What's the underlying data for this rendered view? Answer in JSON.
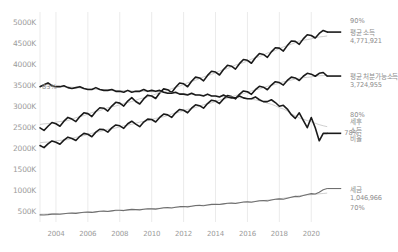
{
  "chart_data": {
    "type": "line",
    "title": "",
    "subtitle": "",
    "xlabel": "",
    "ylabel": "",
    "grid": true,
    "legend_position": "right-annotations",
    "x": [
      2003.0,
      2003.25,
      2003.5,
      2003.75,
      2004.0,
      2004.25,
      2004.5,
      2004.75,
      2005.0,
      2005.25,
      2005.5,
      2005.75,
      2006.0,
      2006.25,
      2006.5,
      2006.75,
      2007.0,
      2007.25,
      2007.5,
      2007.75,
      2008.0,
      2008.25,
      2008.5,
      2008.75,
      2009.0,
      2009.25,
      2009.5,
      2009.75,
      2010.0,
      2010.25,
      2010.5,
      2010.75,
      2011.0,
      2011.25,
      2011.5,
      2011.75,
      2012.0,
      2012.25,
      2012.5,
      2012.75,
      2013.0,
      2013.25,
      2013.5,
      2013.75,
      2014.0,
      2014.25,
      2014.5,
      2014.75,
      2015.0,
      2015.25,
      2015.5,
      2015.75,
      2016.0,
      2016.25,
      2016.5,
      2016.75,
      2017.0,
      2017.25,
      2017.5,
      2017.75,
      2018.0,
      2018.25,
      2018.5,
      2018.75,
      2019.0,
      2019.25,
      2019.5,
      2019.75,
      2020.0,
      2020.25,
      2020.5,
      2020.75,
      2021.0
    ],
    "xlim": [
      2003.0,
      2021.3
    ],
    "x_ticks": [
      "2004",
      "2006",
      "2008",
      "2010",
      "2012",
      "2014",
      "2016",
      "2018",
      "2020"
    ],
    "x_tick_values": [
      2004,
      2006,
      2008,
      2010,
      2012,
      2014,
      2016,
      2018,
      2020
    ],
    "y_left_label_suffix": "K",
    "y_left_ticks": [
      "500K",
      "1000K",
      "1500K",
      "2000K",
      "2500K",
      "3000K",
      "3500K",
      "4000K",
      "4500K",
      "5000K"
    ],
    "y_left_tick_values": [
      500000,
      1000000,
      1500000,
      2000000,
      2500000,
      3000000,
      3500000,
      4000000,
      4500000,
      5000000
    ],
    "ylim_left": [
      250000,
      5250000
    ],
    "y_right_ticks": [
      "70%",
      "80%",
      "90%"
    ],
    "y_right_tick_values": [
      70,
      80,
      90
    ],
    "ylim_right": [
      68.5,
      91.0
    ],
    "series": [
      {
        "name": "평균 소득",
        "axis": "left",
        "color": "#1a1a1a",
        "width": 1.6,
        "end_label": "평균 소득",
        "end_value_label": "4,771,921",
        "end_value": 4771921,
        "values": [
          2490000,
          2430000,
          2530000,
          2620000,
          2590000,
          2530000,
          2650000,
          2740000,
          2700000,
          2640000,
          2760000,
          2850000,
          2830000,
          2760000,
          2880000,
          2970000,
          2960000,
          2890000,
          3010000,
          3100000,
          3080000,
          3010000,
          3130000,
          3210000,
          3120000,
          3060000,
          3180000,
          3270000,
          3250000,
          3190000,
          3320000,
          3420000,
          3400000,
          3330000,
          3460000,
          3560000,
          3540000,
          3470000,
          3600000,
          3700000,
          3680000,
          3610000,
          3740000,
          3840000,
          3820000,
          3750000,
          3880000,
          3980000,
          3960000,
          3890000,
          4020000,
          4120000,
          4100000,
          4030000,
          4160000,
          4260000,
          4240000,
          4170000,
          4300000,
          4400000,
          4390000,
          4320000,
          4450000,
          4560000,
          4550000,
          4480000,
          4610000,
          4710000,
          4690000,
          4630000,
          4740000,
          4810000,
          4771921
        ]
      },
      {
        "name": "평균 처분가능소득",
        "axis": "left",
        "color": "#1a1a1a",
        "width": 1.6,
        "end_label": "평균 처분가능소득",
        "end_value_label": "3,724,955",
        "end_value": 3724955,
        "values": [
          2070000,
          2020000,
          2110000,
          2180000,
          2150000,
          2100000,
          2200000,
          2270000,
          2240000,
          2190000,
          2290000,
          2360000,
          2340000,
          2280000,
          2390000,
          2460000,
          2450000,
          2390000,
          2490000,
          2560000,
          2540000,
          2480000,
          2590000,
          2650000,
          2580000,
          2520000,
          2630000,
          2700000,
          2690000,
          2630000,
          2740000,
          2820000,
          2800000,
          2740000,
          2850000,
          2930000,
          2910000,
          2850000,
          2960000,
          3040000,
          3020000,
          2960000,
          3070000,
          3150000,
          3130000,
          3070000,
          3180000,
          3260000,
          3240000,
          3180000,
          3290000,
          3370000,
          3350000,
          3290000,
          3400000,
          3480000,
          3460000,
          3400000,
          3510000,
          3590000,
          3570000,
          3510000,
          3620000,
          3700000,
          3680000,
          3620000,
          3720000,
          3790000,
          3770000,
          3720000,
          3790000,
          3810000,
          3724955
        ]
      },
      {
        "name": "세후 소득 비율",
        "axis": "right",
        "color": "#1a1a1a",
        "width": 1.6,
        "end_label": "세후\n소득\n비율",
        "end_value_label": "78%",
        "start_value_label": "83%",
        "end_value": 78,
        "values": [
          83.0,
          83.2,
          83.4,
          83.1,
          83.0,
          83.0,
          83.1,
          82.9,
          82.8,
          82.9,
          83.0,
          82.8,
          82.7,
          82.7,
          82.9,
          82.7,
          82.6,
          82.6,
          82.7,
          82.5,
          82.5,
          82.4,
          82.6,
          82.4,
          82.5,
          82.5,
          82.7,
          82.5,
          82.6,
          82.5,
          82.6,
          82.4,
          82.3,
          82.3,
          82.4,
          82.2,
          82.2,
          82.1,
          82.3,
          82.1,
          82.1,
          82.0,
          82.2,
          82.0,
          82.0,
          81.9,
          82.1,
          81.9,
          81.8,
          81.8,
          82.0,
          81.8,
          81.7,
          81.7,
          81.9,
          81.6,
          81.4,
          81.4,
          81.6,
          81.3,
          80.9,
          81.0,
          80.6,
          80.0,
          79.6,
          80.2,
          79.4,
          78.6,
          79.7,
          78.6,
          77.2,
          78.0,
          78.0
        ]
      },
      {
        "name": "세금",
        "axis": "left",
        "color": "#6f6f6f",
        "width": 1.1,
        "end_label": "세금",
        "end_value_label": "1,046,966",
        "end_value": 1046966,
        "values": [
          420000,
          415000,
          425000,
          438000,
          440000,
          435000,
          448000,
          460000,
          462000,
          456000,
          470000,
          482000,
          484000,
          478000,
          492000,
          505000,
          508000,
          500000,
          515000,
          528000,
          530000,
          522000,
          538000,
          550000,
          545000,
          538000,
          552000,
          565000,
          562000,
          556000,
          572000,
          588000,
          592000,
          584000,
          600000,
          615000,
          618000,
          610000,
          626000,
          642000,
          645000,
          638000,
          654000,
          670000,
          672000,
          665000,
          682000,
          698000,
          700000,
          692000,
          710000,
          726000,
          728000,
          720000,
          738000,
          755000,
          760000,
          752000,
          772000,
          790000,
          800000,
          792000,
          815000,
          840000,
          860000,
          850000,
          880000,
          905000,
          925000,
          918000,
          960000,
          1020000,
          1046966
        ]
      }
    ],
    "trend_lines": [
      {
        "name": "평균 소득 추세",
        "axis": "left",
        "color": "#c9c9c9",
        "width": 0.9
      },
      {
        "name": "평균 처분가능소득 추세",
        "axis": "left",
        "color": "#c9c9c9",
        "width": 0.9
      },
      {
        "name": "세후 소득 비율 추세",
        "axis": "right",
        "color": "#c9c9c9",
        "width": 0.9
      },
      {
        "name": "세금 추세",
        "axis": "left",
        "color": "#c9c9c9",
        "width": 0.9
      }
    ],
    "annotations": [
      {
        "id": "pct-90",
        "text": "90%",
        "kind": "right-axis-tick"
      },
      {
        "id": "avg-income",
        "text": "평균 소득",
        "value": "4,771,921",
        "kind": "series-label"
      },
      {
        "id": "avg-disposable",
        "text": "평균 처분가능소득",
        "value": "3,724,955",
        "kind": "series-label"
      },
      {
        "id": "pct-80",
        "text": "80%",
        "kind": "right-axis-tick"
      },
      {
        "id": "ratio-label",
        "text": "세후\n소득\n비율",
        "kind": "series-label"
      },
      {
        "id": "pct-78",
        "text": "78%",
        "kind": "callout"
      },
      {
        "id": "pct-83",
        "text": "83%",
        "kind": "callout"
      },
      {
        "id": "tax",
        "text": "세금",
        "value": "1,046,966",
        "kind": "series-label"
      },
      {
        "id": "pct-70",
        "text": "70%",
        "kind": "right-axis-tick"
      }
    ],
    "colors": {
      "line_primary": "#1a1a1a",
      "line_secondary": "#6f6f6f",
      "trend": "#c9c9c9",
      "grid": "#ebebeb",
      "axis_text": "#9b9b9b",
      "annotation_text": "#8d8d8d",
      "background": "#ffffff"
    }
  },
  "right_axis": {
    "ticks": [
      {
        "label": "90%"
      },
      {
        "label": "80%"
      },
      {
        "label": "70%"
      }
    ]
  },
  "labels": {
    "avg_income_name": "평균 소득",
    "avg_income_value": "4,771,921",
    "avg_disposable_name": "평균 처분가능소득",
    "avg_disposable_value": "3,724,955",
    "ratio_line1": "세후",
    "ratio_line2": "소득",
    "ratio_line3": "비율",
    "ratio_end_pct": "78%",
    "ratio_start_pct": "83%",
    "tax_name": "세금",
    "tax_value": "1,046,966",
    "pct_90": "90%",
    "pct_80": "80%",
    "pct_70": "70%"
  }
}
